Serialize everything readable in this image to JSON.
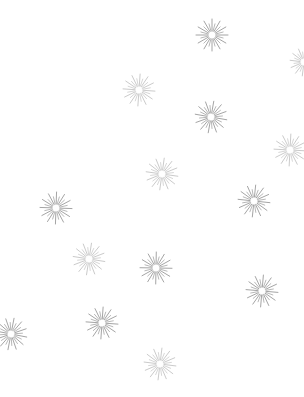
{
  "pattern": {
    "background": "#ffffff",
    "rays": 24,
    "inner_radius": 4,
    "colors": {
      "medium": "#9a9a9a",
      "light": "#c4c4c4"
    },
    "bursts": [
      {
        "x": 212,
        "y": 35,
        "r": 16,
        "shade": "medium",
        "rot": 0
      },
      {
        "x": 304,
        "y": 62,
        "r": 14,
        "shade": "light",
        "rot": 7
      },
      {
        "x": 139,
        "y": 90,
        "r": 16,
        "shade": "light",
        "rot": 4
      },
      {
        "x": 211,
        "y": 117,
        "r": 16,
        "shade": "medium",
        "rot": 10
      },
      {
        "x": 290,
        "y": 150,
        "r": 16,
        "shade": "light",
        "rot": 3
      },
      {
        "x": 162,
        "y": 174,
        "r": 16,
        "shade": "light",
        "rot": 8
      },
      {
        "x": 56,
        "y": 208,
        "r": 16,
        "shade": "medium",
        "rot": 2
      },
      {
        "x": 254,
        "y": 201,
        "r": 16,
        "shade": "medium",
        "rot": 6
      },
      {
        "x": 89,
        "y": 259,
        "r": 16,
        "shade": "light",
        "rot": 9
      },
      {
        "x": 156,
        "y": 268,
        "r": 16,
        "shade": "medium",
        "rot": 1
      },
      {
        "x": 262,
        "y": 291,
        "r": 16,
        "shade": "medium",
        "rot": 5
      },
      {
        "x": 11,
        "y": 334,
        "r": 16,
        "shade": "medium",
        "rot": 11
      },
      {
        "x": 102,
        "y": 323,
        "r": 16,
        "shade": "medium",
        "rot": 4
      },
      {
        "x": 160,
        "y": 364,
        "r": 16,
        "shade": "light",
        "rot": 7
      }
    ]
  }
}
